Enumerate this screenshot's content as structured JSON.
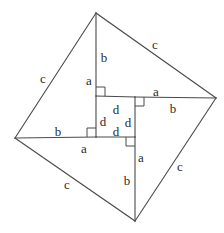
{
  "figure": {
    "stroke_color": "#4a4a4a",
    "label_color": "#2b2b2b",
    "background_color": "#ffffff",
    "canvas": {
      "width": 224,
      "height": 233
    }
  },
  "vertices": {
    "outer": {
      "top": {
        "x": 96,
        "y": 13
      },
      "right": {
        "x": 216,
        "y": 98
      },
      "bottom": {
        "x": 135,
        "y": 221
      },
      "left": {
        "x": 15,
        "y": 138
      }
    },
    "inner": {
      "top_left": {
        "x": 96,
        "y": 96
      },
      "top_right": {
        "x": 135,
        "y": 97
      },
      "bottom_right": {
        "x": 135,
        "y": 137
      },
      "bottom_left": {
        "x": 96,
        "y": 137
      }
    }
  },
  "labels": [
    {
      "id": "c-top-left",
      "text": "c",
      "x": 43,
      "y": 78
    },
    {
      "id": "c-top-right",
      "text": "c",
      "x": 155,
      "y": 44
    },
    {
      "id": "c-bottom-right",
      "text": "c",
      "x": 180,
      "y": 166
    },
    {
      "id": "c-bottom-left",
      "text": "c",
      "x": 67,
      "y": 184
    },
    {
      "id": "b-top",
      "text": "b",
      "x": 104,
      "y": 57
    },
    {
      "id": "a-top",
      "text": "a",
      "x": 89,
      "y": 80
    },
    {
      "id": "a-right",
      "text": "a",
      "x": 156,
      "y": 91
    },
    {
      "id": "b-right",
      "text": "b",
      "x": 173,
      "y": 108
    },
    {
      "id": "a-bottom",
      "text": "a",
      "x": 141,
      "y": 157
    },
    {
      "id": "b-bottom",
      "text": "b",
      "x": 127,
      "y": 180
    },
    {
      "id": "b-left",
      "text": "b",
      "x": 58,
      "y": 131
    },
    {
      "id": "a-left",
      "text": "a",
      "x": 84,
      "y": 148
    },
    {
      "id": "d-north",
      "text": "d",
      "x": 116,
      "y": 109
    },
    {
      "id": "d-west",
      "text": "d",
      "x": 103,
      "y": 121
    },
    {
      "id": "d-east",
      "text": "d",
      "x": 128,
      "y": 122
    },
    {
      "id": "d-south",
      "text": "d",
      "x": 116,
      "y": 131
    }
  ],
  "side_lengths": {
    "outer_side": "c",
    "inner_side": "d",
    "triangle_leg_long": "b",
    "triangle_leg_short": "a"
  },
  "right_angle_markers": [
    {
      "id": "ra-top-left",
      "corner_x": 96,
      "corner_y": 96,
      "dir_x": 1,
      "dir_y": -1
    },
    {
      "id": "ra-top-right",
      "corner_x": 135,
      "corner_y": 97,
      "dir_x": 1,
      "dir_y": 1
    },
    {
      "id": "ra-bottom-right",
      "corner_x": 135,
      "corner_y": 137,
      "dir_x": -1,
      "dir_y": 1
    },
    {
      "id": "ra-bottom-left",
      "corner_x": 96,
      "corner_y": 137,
      "dir_x": -1,
      "dir_y": -1
    }
  ]
}
